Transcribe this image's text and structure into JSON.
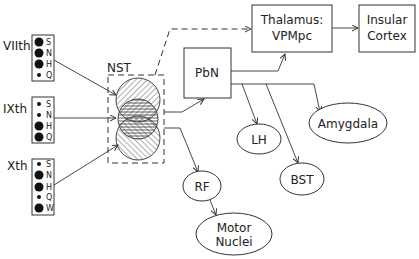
{
  "diagram": {
    "nerves": [
      {
        "label": "VIIth",
        "key": [
          {
            "letter": "S",
            "size": "large"
          },
          {
            "letter": "N",
            "size": "large"
          },
          {
            "letter": "H",
            "size": "large"
          },
          {
            "letter": "Q",
            "size": "small"
          }
        ]
      },
      {
        "label": "IXth",
        "key": [
          {
            "letter": "S",
            "size": "small"
          },
          {
            "letter": "N",
            "size": "small"
          },
          {
            "letter": "H",
            "size": "large"
          },
          {
            "letter": "Q",
            "size": "large"
          }
        ]
      },
      {
        "label": "Xth",
        "key": [
          {
            "letter": "S",
            "size": "small"
          },
          {
            "letter": "N",
            "size": "large"
          },
          {
            "letter": "H",
            "size": "large"
          },
          {
            "letter": "Q",
            "size": "small"
          },
          {
            "letter": "W",
            "size": "large"
          }
        ]
      }
    ],
    "nst_label": "NST",
    "nodes": {
      "pbn": "PbN",
      "thalamus_line1": "Thalamus:",
      "thalamus_line2": "VPMpc",
      "insular_line1": "Insular",
      "insular_line2": "Cortex",
      "lh": "LH",
      "amygdala": "Amygdala",
      "bst": "BST",
      "rf": "RF",
      "motor_line1": "Motor",
      "motor_line2": "Nuclei"
    },
    "edges": [
      {
        "from": "VIIth",
        "to": "NST"
      },
      {
        "from": "IXth",
        "to": "NST"
      },
      {
        "from": "Xth",
        "to": "NST"
      },
      {
        "from": "NST",
        "to": "Thalamus: VPMpc",
        "style": "dashed"
      },
      {
        "from": "NST",
        "to": "PbN"
      },
      {
        "from": "NST",
        "to": "RF"
      },
      {
        "from": "PbN",
        "to": "Thalamus: VPMpc"
      },
      {
        "from": "PbN",
        "to": "LH"
      },
      {
        "from": "PbN",
        "to": "BST"
      },
      {
        "from": "PbN",
        "to": "Amygdala"
      },
      {
        "from": "Thalamus: VPMpc",
        "to": "Insular Cortex"
      },
      {
        "from": "RF",
        "to": "Motor Nuclei"
      }
    ]
  }
}
